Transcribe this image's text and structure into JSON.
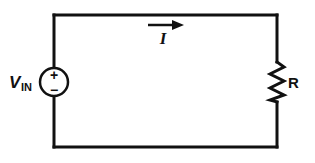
{
  "diagram": {
    "type": "circuit",
    "title": "",
    "source": {
      "kind": "voltage-source",
      "label_main": "V",
      "label_sub": "IN",
      "plus": "+",
      "minus": "−"
    },
    "current": {
      "label": "I",
      "direction": "right"
    },
    "resistor": {
      "label": "R"
    },
    "colors": {
      "stroke": "#111111",
      "background": "#ffffff"
    }
  }
}
